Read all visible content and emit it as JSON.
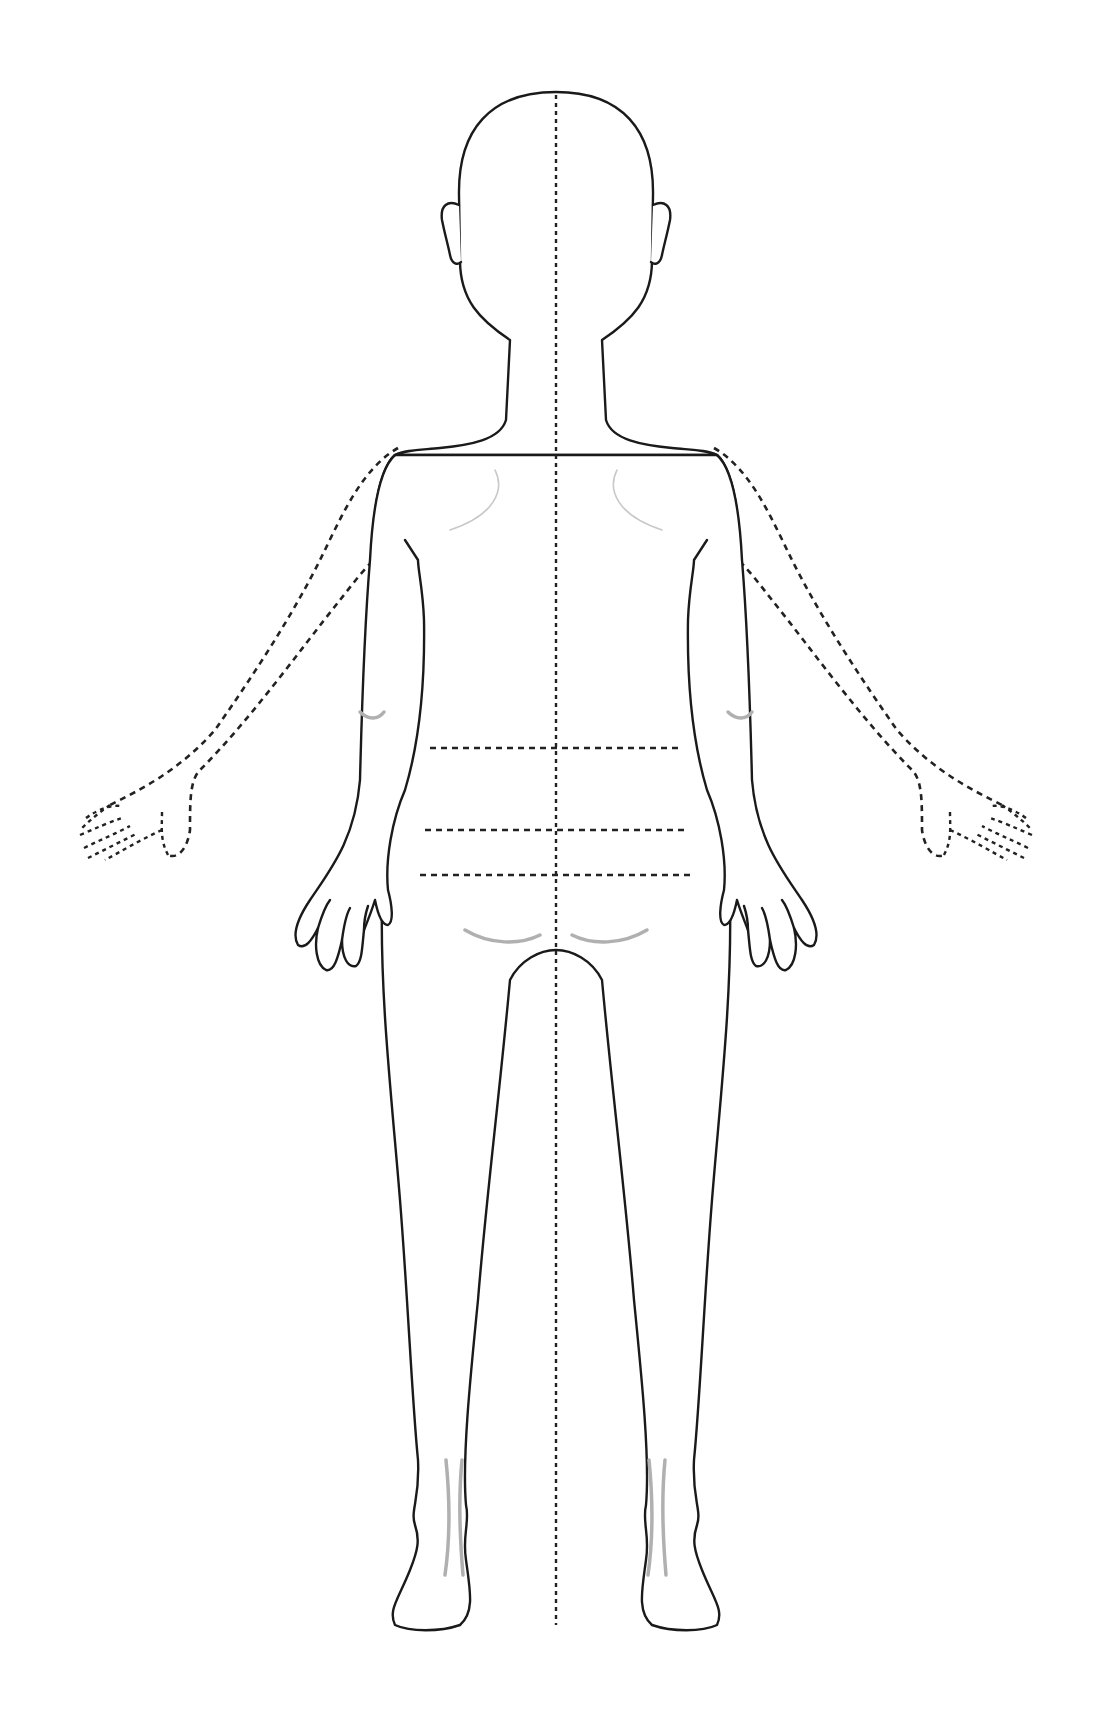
{
  "diagram": {
    "type": "body-outline",
    "view": "posterior",
    "colors": {
      "background": "#ffffff",
      "outline": "#1a1a1a",
      "dashed_guides": "#222222",
      "shading": "#b0b0b0"
    },
    "midline": {
      "x": 556,
      "y_start": 95,
      "y_end": 1625,
      "style": "dotted"
    },
    "horizontal_bands": [
      {
        "name": "band-1",
        "y": 748,
        "x_start": 430,
        "x_end": 680
      },
      {
        "name": "band-2",
        "y": 830,
        "x_start": 425,
        "x_end": 686
      },
      {
        "name": "band-3",
        "y": 875,
        "x_start": 420,
        "x_end": 690
      }
    ],
    "raised_arms": {
      "left": "dashed",
      "right": "dashed"
    },
    "labels": []
  }
}
